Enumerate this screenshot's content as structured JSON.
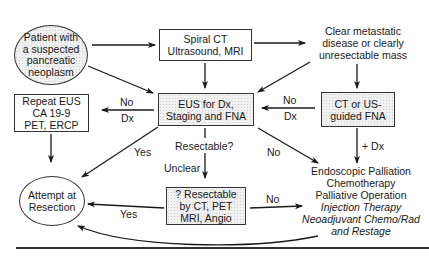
{
  "diagram": {
    "type": "flowchart",
    "topic": "Evaluation of suspected pancreatic neoplasm",
    "nodes": {
      "start": {
        "lines": [
          "Patient with",
          "a suspected",
          "pancreatic",
          "neoplasm"
        ],
        "shape": "circle-shaded"
      },
      "imaging": {
        "lines": [
          "Spiral CT",
          "Ultrasound, MRI"
        ],
        "shape": "box"
      },
      "metastatic": {
        "lines": [
          "Clear metastatic",
          "disease or clearly",
          "unresectable mass"
        ],
        "shape": "text"
      },
      "eus": {
        "lines": [
          "EUS for Dx,",
          "Staging and FNA"
        ],
        "shape": "box-shaded"
      },
      "ct_fna": {
        "lines": [
          "CT or US-",
          "guided FNA"
        ],
        "shape": "box-shaded"
      },
      "repeat": {
        "lines": [
          "Repeat EUS",
          "CA 19-9",
          "PET, ERCP"
        ],
        "shape": "box"
      },
      "resection": {
        "lines": [
          "Attempt at",
          "Resection"
        ],
        "shape": "circle"
      },
      "resectable_q": {
        "lines": [
          "? Resectable",
          "by CT, PET",
          "MRI, Angio"
        ],
        "shape": "box-shaded"
      },
      "palliation": {
        "lines": [
          "Endoscopic Palliation",
          "Chemotherapy",
          "Palliative Operation"
        ],
        "italic_lines": [
          "Injection Therapy",
          "Neoadjuvant Chemo/Rad",
          "and Restage"
        ],
        "shape": "text"
      }
    },
    "edge_labels": {
      "eus_to_repeat_top": "No",
      "eus_to_repeat_bottom": "Dx",
      "ctfna_to_eus_top": "No",
      "ctfna_to_eus_bottom": "Dx",
      "eus_to_resection": "Yes",
      "eus_question": "Resectable?",
      "eus_to_resectable_q": "Unclear",
      "eus_to_palliation": "No",
      "ctfna_to_palliation": "+ Dx",
      "resq_to_resection": "Yes",
      "resq_to_palliation": "No"
    }
  }
}
